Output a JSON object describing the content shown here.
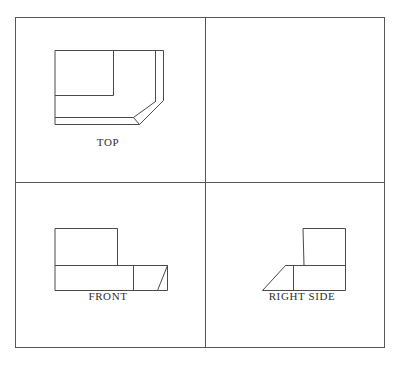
{
  "sheet": {
    "title": "Orthographic Multiview Drawing",
    "background_color": "#ffffff",
    "width": 400,
    "height": 365,
    "frame_color": "#565656",
    "line_color": "#4a4a4a",
    "label_color": "#2f2f2f"
  },
  "frame": {
    "outer": {
      "x": 15,
      "y": 17,
      "width": 370,
      "height": 331
    },
    "divider_vertical": {
      "x": 205,
      "y1": 17,
      "y2": 348
    },
    "divider_horizontal": {
      "y": 182,
      "x1": 15,
      "x2": 385
    }
  },
  "views": {
    "top": {
      "label": "TOP",
      "label_x": 108,
      "label_y": 146,
      "panel": {
        "x": 15,
        "y": 17,
        "width": 190,
        "height": 165
      },
      "outline": "M55,50 L163,50 L163,100 L139,124 L55,124 Z",
      "paths": [
        "M55,50 L163,50 L163,100 L139,124 L55,124 Z",
        "M55,95 L113,95 L113,50",
        "M155,50 L155,101",
        "M55,117 L133,117 L155,101",
        "M133,117 L139,124"
      ]
    },
    "front": {
      "label": "FRONT",
      "label_x": 108,
      "label_y": 300,
      "panel": {
        "x": 15,
        "y": 182,
        "width": 190,
        "height": 166
      },
      "paths": [
        "M55,228 L117,228 L117,265 L167,265 L167,290 L55,290 Z",
        "M55,265 L117,265",
        "M133,265 L133,290",
        "M167,265 L167,290"
      ]
    },
    "right_side": {
      "label": "RIGHT SIDE",
      "label_x": 302,
      "label_y": 300,
      "panel": {
        "x": 205,
        "y": 182,
        "width": 180,
        "height": 166
      },
      "paths": [
        "M303,228 L345,228 L345,290 L262,290 L293,265 L303,265 Z",
        "M293,265 L345,265",
        "M293,265 L293,290"
      ]
    }
  },
  "geometry_notes": {
    "projection": "third-angle orthographic",
    "view_count": 3,
    "feature": "chamfered corner block"
  }
}
